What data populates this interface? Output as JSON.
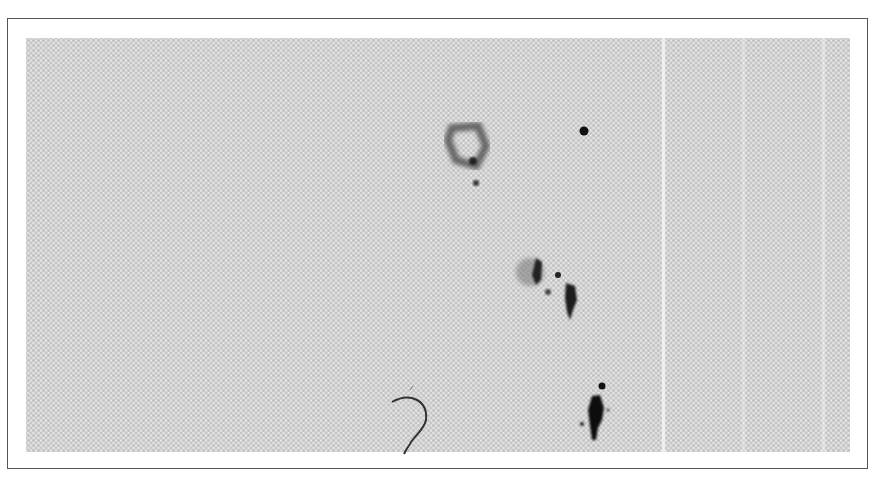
{
  "image": {
    "description": "Halftone grayscale scan of a speckled field with dark blob features inside a thin rectangular border",
    "colors": {
      "background": "#ffffff",
      "border": "#555555",
      "field": "#e6e6e6",
      "dots": "#c4c4c4",
      "features": "#1a1a1a"
    },
    "features": [
      {
        "name": "ring-blob",
        "x": 466,
        "y": 143
      },
      {
        "name": "small-dot-top",
        "x": 584,
        "y": 131
      },
      {
        "name": "speck-under-ring",
        "x": 475,
        "y": 183
      },
      {
        "name": "cluster-blob",
        "x": 537,
        "y": 273
      },
      {
        "name": "vertical-blob",
        "x": 570,
        "y": 295
      },
      {
        "name": "curved-fiber",
        "x": 410,
        "y": 420
      },
      {
        "name": "bottom-blob",
        "x": 595,
        "y": 418
      },
      {
        "name": "bottom-dot",
        "x": 602,
        "y": 386
      }
    ]
  }
}
